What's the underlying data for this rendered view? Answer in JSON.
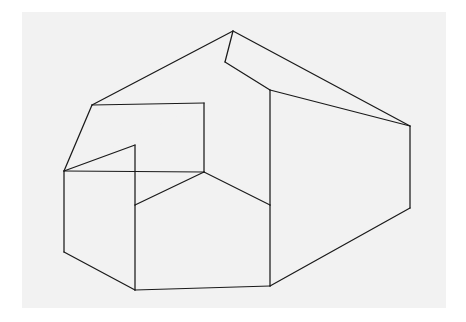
{
  "figure": {
    "kind": "line-drawing",
    "projection": "isometric",
    "style": {
      "page_background": "#ffffff",
      "plate_background": "#f2f2f2",
      "line_color": "#1a1a1a",
      "face_fill": "#f2f2f2",
      "line_width": 1.25
    },
    "plate": {
      "x": 22,
      "y": 12,
      "width": 424,
      "height": 296
    },
    "vertices": {
      "roof_apex": [
        233,
        31
      ],
      "roof_ridge_inner": [
        225,
        62
      ],
      "roof_back_left": [
        92,
        105
      ],
      "roof_front_peak": [
        270,
        90
      ],
      "roof_right": [
        410,
        126
      ],
      "left_outer_top": [
        64,
        171
      ],
      "notch_top": [
        204,
        103
      ],
      "notch_inner_bottom": [
        204,
        172
      ],
      "mid_left_corner": [
        135,
        145
      ],
      "notch_left_ledge": [
        135,
        205
      ],
      "front_center_corner": [
        270,
        205
      ],
      "bottom_left": [
        135,
        290
      ],
      "bottom_center": [
        270,
        286
      ],
      "bottom_right": [
        410,
        208
      ],
      "left_bottom": [
        64,
        252
      ]
    },
    "edges": [
      {
        "name": "ridge-apex-to-back-left",
        "from": "roof_apex",
        "to": "roof_back_left"
      },
      {
        "name": "ridge-apex-to-inner",
        "from": "roof_apex",
        "to": "roof_ridge_inner"
      },
      {
        "name": "ridge-apex-to-right",
        "from": "roof_apex",
        "to": "roof_right"
      },
      {
        "name": "roof-inner-to-front-peak",
        "from": "roof_ridge_inner",
        "to": "roof_front_peak"
      },
      {
        "name": "roof-front-peak-to-right",
        "from": "roof_front_peak",
        "to": "roof_right"
      },
      {
        "name": "back-left-to-left-outer",
        "from": "roof_back_left",
        "to": "left_outer_top"
      },
      {
        "name": "back-left-to-notch-top",
        "from": "roof_back_left",
        "to": "notch_top"
      },
      {
        "name": "notch-top-vertical",
        "from": "notch_top",
        "to": "notch_inner_bottom"
      },
      {
        "name": "left-outer-to-notch-inner",
        "from": "left_outer_top",
        "to": "notch_inner_bottom"
      },
      {
        "name": "left-outer-to-mid-left",
        "from": "left_outer_top",
        "to": "mid_left_corner"
      },
      {
        "name": "mid-left-vertical",
        "from": "mid_left_corner",
        "to": "notch_left_ledge"
      },
      {
        "name": "ledge-to-notch-inner",
        "from": "notch_left_ledge",
        "to": "notch_inner_bottom"
      },
      {
        "name": "notch-inner-to-front-center",
        "from": "notch_inner_bottom",
        "to": "front_center_corner"
      },
      {
        "name": "front-peak-vertical",
        "from": "roof_front_peak",
        "to": "front_center_corner"
      },
      {
        "name": "front-center-vertical",
        "from": "front_center_corner",
        "to": "bottom_center"
      },
      {
        "name": "ledge-to-bottom-left",
        "from": "notch_left_ledge",
        "to": "bottom_left"
      },
      {
        "name": "bottom-left-to-bottom-center",
        "from": "bottom_left",
        "to": "bottom_center"
      },
      {
        "name": "left-outer-vertical",
        "from": "left_outer_top",
        "to": "left_bottom"
      },
      {
        "name": "left-bottom-to-bottom-left",
        "from": "left_bottom",
        "to": "bottom_left"
      },
      {
        "name": "right-vertical",
        "from": "roof_right",
        "to": "bottom_right"
      },
      {
        "name": "bottom-center-to-bottom-right",
        "from": "bottom_center",
        "to": "bottom_right"
      }
    ]
  }
}
